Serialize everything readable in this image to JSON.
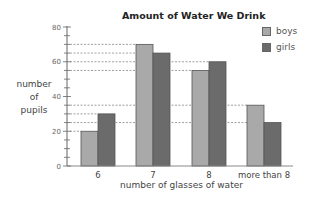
{
  "chart_data": {
    "type": "bar",
    "title": "Amount of Water We Drink",
    "xlabel": "number of glasses of water",
    "ylabel": "number of pupils",
    "ylabel_lines": [
      "number",
      "of",
      "pupils"
    ],
    "ylim": [
      0,
      80
    ],
    "yticks_major": [
      0,
      20,
      40,
      60,
      80
    ],
    "yticks_minor_step": 5,
    "categories": [
      "6",
      "7",
      "8",
      "more than 8"
    ],
    "series": [
      {
        "name": "boys",
        "color": "#a9a9a9",
        "values": [
          20,
          70,
          55,
          35
        ]
      },
      {
        "name": "girls",
        "color": "#6b6b6b",
        "values": [
          30,
          65,
          60,
          25
        ]
      }
    ],
    "reference_lines": [
      70,
      65,
      60,
      55,
      35,
      30,
      25,
      20
    ],
    "grid": false,
    "legend_position": "top-right"
  }
}
